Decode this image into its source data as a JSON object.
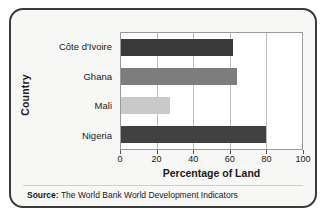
{
  "card": {
    "source_prefix": "Source:",
    "source_text": "The World Bank World Development Indicators"
  },
  "chart_data": {
    "type": "bar",
    "orientation": "horizontal",
    "title": "",
    "xlabel": "Percentage of Land",
    "ylabel": "Country",
    "categories": [
      "Côte d'Ivoire",
      "Ghana",
      "Mali",
      "Nigeria"
    ],
    "values": [
      62,
      64,
      27,
      80
    ],
    "bar_colors": [
      "#3a3a3a",
      "#7d7d7d",
      "#c9c9c9",
      "#414141"
    ],
    "xlim": [
      0,
      100
    ],
    "xticks": [
      0,
      20,
      40,
      60,
      80,
      100
    ],
    "xtick_labels": [
      "0",
      "20",
      "40",
      "60",
      "80",
      "100"
    ],
    "grid": "vertical",
    "legend": "none"
  }
}
